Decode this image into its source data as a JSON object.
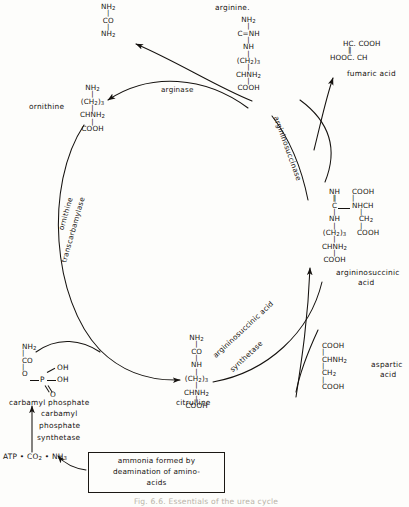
{
  "figure": {
    "caption": "Fig. 6.6. Essentials of the urea cycle"
  },
  "metabolites": {
    "urea": {
      "name": "urea",
      "rows": [
        "NH",
        "CO",
        "NH"
      ],
      "r1": "NH",
      "r1s": "2",
      "r2": "CO",
      "r3": "NH",
      "r3s": "2"
    },
    "arginine": {
      "label": "arginine.",
      "r1": "NH",
      "r1s": "2",
      "r2": "C=NH",
      "r3": "NH",
      "r4a": "(CH",
      "r4s": "2",
      "r4b": ")",
      "r4s2": "3",
      "r5": "CHNH",
      "r5s": "2",
      "r6": "COOH"
    },
    "ornithine": {
      "label": "ornithine",
      "r1": "NH",
      "r1s": "2",
      "r2a": "(CH",
      "r2s": "2",
      "r2b": ")",
      "r2s2": "3",
      "r3": "CHNH",
      "r3s": "2",
      "r4": "COOH"
    },
    "citrulline": {
      "label": "citrulline",
      "r1": "NH",
      "r1s": "2",
      "r2": "CO",
      "r3": "NH",
      "r4a": "(CH",
      "r4s": "2",
      "r4b": ")",
      "r4s2": "3",
      "r5": "CHNH",
      "r5s": "2",
      "r6": "COOH"
    },
    "argininosuccinic_acid": {
      "label_line1": "argininosuccinic",
      "label_line2": "acid",
      "left_r1": "NH",
      "left_r2": "C",
      "left_r3": "NH",
      "left_r4a": "(CH",
      "left_r4s": "2",
      "left_r4b": ")",
      "left_r4s2": "3",
      "left_r5": "CHNH",
      "left_r5s": "2",
      "left_r6": "COOH",
      "right_r1": "COOH",
      "right_r2": "NHCH",
      "right_r3": "CH",
      "right_r3s": "2",
      "right_r4": "COOH"
    },
    "fumaric_acid": {
      "label": "fumaric acid",
      "r1": "HC. COOH",
      "r2": "HOOC. CH"
    },
    "aspartic_acid": {
      "label_line1": "aspartic",
      "label_line2": "acid",
      "r1": "COOH",
      "r2": "CHNH",
      "r2s": "2",
      "r3": "CH",
      "r3s": "2",
      "r4": "COOH"
    },
    "carbamyl_phosphate": {
      "label": "carbamyl  phosphate",
      "r1": "NH",
      "r1s": "2",
      "r2": "CO",
      "r3": "O",
      "p": "P",
      "oh1": "OH",
      "oh2": "OH",
      "o_double": "O"
    },
    "substrates": {
      "atp_line": "ATP • CO",
      "atp_sub": "2",
      "atp_mid": " • NH",
      "atp_sub2": "3"
    }
  },
  "enzymes": {
    "arginase": "arginase",
    "argininosuccinase": "argininosuccinase",
    "argininosuccinic_acid_synthetase_line1": "argininosuccinic  acid",
    "argininosuccinic_acid_synthetase_line2": "synthetase",
    "ornithine_transcarbamylase_line1": "ornithine",
    "ornithine_transcarbamylase_line2": "transcarbamylase",
    "carbamyl_phosphate_synthetase_line1": "carbamyl",
    "carbamyl_phosphate_synthetase_line2": "phosphate",
    "carbamyl_phosphate_synthetase_line3": "synthetase"
  },
  "annotation": {
    "line1": "ammonia  formed  by",
    "line2": "deamination of amino-",
    "line3": "acids"
  },
  "colors": {
    "ink": "#15120f",
    "paper": "#fdfdfb",
    "caption": "#b9b3a8"
  }
}
